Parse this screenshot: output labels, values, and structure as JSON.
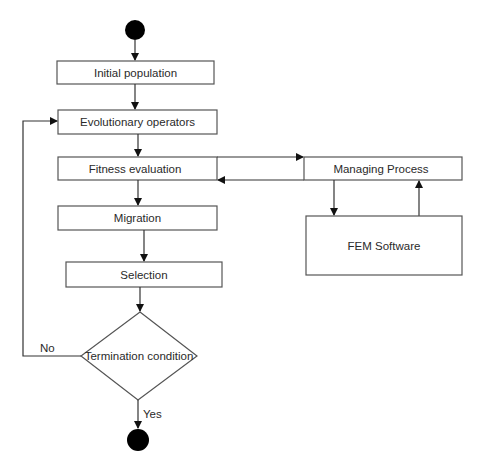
{
  "diagram": {
    "type": "flowchart",
    "nodes": {
      "start": {
        "shape": "filled-circle"
      },
      "initial_population": {
        "label": "Initial population"
      },
      "evolutionary_operators": {
        "label": "Evolutionary operators"
      },
      "fitness_evaluation": {
        "label": "Fitness evaluation"
      },
      "managing_process": {
        "label": "Managing Process"
      },
      "fem_software": {
        "label": "FEM Software"
      },
      "migration": {
        "label": "Migration"
      },
      "selection": {
        "label": "Selection"
      },
      "termination_condition": {
        "label": "Termination condition",
        "shape": "diamond"
      },
      "end": {
        "shape": "filled-circle"
      }
    },
    "edge_labels": {
      "no": "No",
      "yes": "Yes"
    },
    "edges": [
      {
        "from": "start",
        "to": "initial_population"
      },
      {
        "from": "initial_population",
        "to": "evolutionary_operators"
      },
      {
        "from": "evolutionary_operators",
        "to": "fitness_evaluation"
      },
      {
        "from": "fitness_evaluation",
        "to": "managing_process"
      },
      {
        "from": "managing_process",
        "to": "fitness_evaluation"
      },
      {
        "from": "managing_process",
        "to": "fem_software"
      },
      {
        "from": "fem_software",
        "to": "managing_process"
      },
      {
        "from": "fitness_evaluation",
        "to": "migration"
      },
      {
        "from": "migration",
        "to": "selection"
      },
      {
        "from": "selection",
        "to": "termination_condition"
      },
      {
        "from": "termination_condition",
        "to": "evolutionary_operators",
        "label": "No"
      },
      {
        "from": "termination_condition",
        "to": "end",
        "label": "Yes"
      }
    ]
  }
}
